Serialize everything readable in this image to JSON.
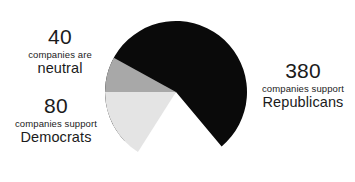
{
  "chart_data": {
    "type": "pie",
    "title": "",
    "subtitle": "",
    "xlabel": "",
    "ylabel": "",
    "legend_position": "none",
    "grid": false,
    "total": 500,
    "unit": "companies",
    "categories": [
      "Republicans",
      "Democrats",
      "neutral"
    ],
    "values": [
      380,
      80,
      40
    ],
    "slices": [
      {
        "name": "Republicans",
        "value": 380,
        "percent": 76,
        "color": "#0a0a0a",
        "start_angle_deg": -50,
        "end_angle_deg": 223.6,
        "label_value": "380",
        "label_mid": "companies support",
        "label_name": "Republicans"
      },
      {
        "name": "Democrats",
        "value": 80,
        "percent": 16,
        "color": "#e4e4e4",
        "start_angle_deg": 180,
        "end_angle_deg": 237.6,
        "label_value": "80",
        "label_mid": "companies support",
        "label_name": "Democrats"
      },
      {
        "name": "neutral",
        "value": 40,
        "percent": 8,
        "color": "#a8a8a8",
        "start_angle_deg": 151.2,
        "end_angle_deg": 180,
        "label_value": "40",
        "label_mid": "companies are",
        "label_name": "neutral"
      }
    ],
    "geometry": {
      "center_x": 176,
      "center_y": 92,
      "radius": 71
    },
    "background_color": "#ffffff",
    "text_color": "#1b1b1b"
  },
  "labels": {
    "neutral": {
      "value": "40",
      "mid": "companies are",
      "name": "neutral"
    },
    "democrats": {
      "value": "80",
      "mid": "companies support",
      "name": "Democrats"
    },
    "republicans": {
      "value": "380",
      "mid": "companies support",
      "name": "Republicans"
    }
  }
}
